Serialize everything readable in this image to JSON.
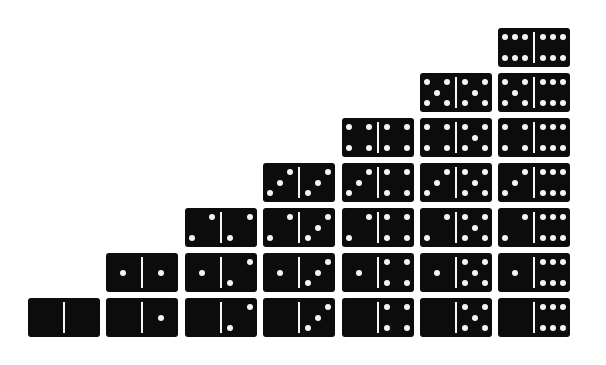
{
  "colors": {
    "tile": "#0c0c0c",
    "pip": "#f4f4f4",
    "background": "#ffffff"
  },
  "layout": {
    "column_x": [
      28,
      106,
      185,
      263,
      342,
      420,
      498
    ],
    "row_y_from_bottom": [
      298,
      253,
      208,
      163,
      118,
      73,
      28
    ]
  },
  "dominoes": [
    {
      "col": 0,
      "row": 0,
      "left": 0,
      "right": 0
    },
    {
      "col": 1,
      "row": 0,
      "left": 0,
      "right": 1
    },
    {
      "col": 1,
      "row": 1,
      "left": 1,
      "right": 1
    },
    {
      "col": 2,
      "row": 0,
      "left": 0,
      "right": 2
    },
    {
      "col": 2,
      "row": 1,
      "left": 1,
      "right": 2
    },
    {
      "col": 2,
      "row": 2,
      "left": 2,
      "right": 2
    },
    {
      "col": 3,
      "row": 0,
      "left": 0,
      "right": 3
    },
    {
      "col": 3,
      "row": 1,
      "left": 1,
      "right": 3
    },
    {
      "col": 3,
      "row": 2,
      "left": 2,
      "right": 3
    },
    {
      "col": 3,
      "row": 3,
      "left": 3,
      "right": 3
    },
    {
      "col": 4,
      "row": 0,
      "left": 0,
      "right": 4
    },
    {
      "col": 4,
      "row": 1,
      "left": 1,
      "right": 4
    },
    {
      "col": 4,
      "row": 2,
      "left": 2,
      "right": 4
    },
    {
      "col": 4,
      "row": 3,
      "left": 3,
      "right": 4
    },
    {
      "col": 4,
      "row": 4,
      "left": 4,
      "right": 4
    },
    {
      "col": 5,
      "row": 0,
      "left": 0,
      "right": 5
    },
    {
      "col": 5,
      "row": 1,
      "left": 1,
      "right": 5
    },
    {
      "col": 5,
      "row": 2,
      "left": 2,
      "right": 5
    },
    {
      "col": 5,
      "row": 3,
      "left": 3,
      "right": 5
    },
    {
      "col": 5,
      "row": 4,
      "left": 4,
      "right": 5
    },
    {
      "col": 5,
      "row": 5,
      "left": 5,
      "right": 5
    },
    {
      "col": 6,
      "row": 0,
      "left": 0,
      "right": 6
    },
    {
      "col": 6,
      "row": 1,
      "left": 1,
      "right": 6
    },
    {
      "col": 6,
      "row": 2,
      "left": 2,
      "right": 6
    },
    {
      "col": 6,
      "row": 3,
      "left": 3,
      "right": 6
    },
    {
      "col": 6,
      "row": 4,
      "left": 4,
      "right": 6
    },
    {
      "col": 6,
      "row": 5,
      "left": 5,
      "right": 6
    },
    {
      "col": 6,
      "row": 6,
      "left": 6,
      "right": 6
    }
  ]
}
